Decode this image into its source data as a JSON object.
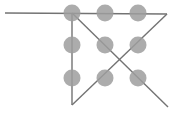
{
  "figure": {
    "width": 177,
    "height": 115,
    "background_color": "#ffffff",
    "line_color": "#737373",
    "line_width": 1.4,
    "dot_color": "#9e9e9e",
    "dot_opacity": 0.85,
    "dot_radius": 8.5,
    "segments": [
      {
        "name": "horizontal-top-line",
        "x1": 5,
        "y1": 13,
        "x2": 167,
        "y2": 14
      },
      {
        "name": "vertical-left-line",
        "x1": 72,
        "y1": 13,
        "x2": 72,
        "y2": 105
      },
      {
        "name": "diagonal-down-right",
        "x1": 72,
        "y1": 13,
        "x2": 168,
        "y2": 107
      },
      {
        "name": "diagonal-down-left",
        "x1": 167,
        "y1": 14,
        "x2": 72,
        "y2": 105
      }
    ],
    "dots": [
      {
        "name": "dot-r1c1",
        "cx": 72,
        "cy": 13
      },
      {
        "name": "dot-r1c2",
        "cx": 105,
        "cy": 13
      },
      {
        "name": "dot-r1c3",
        "cx": 138,
        "cy": 13
      },
      {
        "name": "dot-r2c1",
        "cx": 72,
        "cy": 45
      },
      {
        "name": "dot-r2c2",
        "cx": 105,
        "cy": 45
      },
      {
        "name": "dot-r2c3",
        "cx": 138,
        "cy": 45
      },
      {
        "name": "dot-r3c1",
        "cx": 72,
        "cy": 78
      },
      {
        "name": "dot-r3c2",
        "cx": 105,
        "cy": 78
      },
      {
        "name": "dot-r3c3",
        "cx": 138,
        "cy": 78
      }
    ]
  },
  "chart_data": {
    "type": "scatter",
    "title": "",
    "xlabel": "",
    "ylabel": "",
    "grid": false,
    "legend": "none",
    "xlim": [
      0,
      177
    ],
    "ylim": [
      115,
      0
    ],
    "series": [
      {
        "name": "marked-points",
        "x": [
          72,
          105,
          138,
          72,
          105,
          138,
          72,
          105,
          138
        ],
        "y": [
          13,
          13,
          13,
          45,
          45,
          45,
          78,
          78,
          78
        ]
      }
    ],
    "annotations": [
      {
        "type": "line",
        "name": "horizontal-top-line",
        "points": [
          [
            5,
            13
          ],
          [
            167,
            14
          ]
        ]
      },
      {
        "type": "line",
        "name": "vertical-left-line",
        "points": [
          [
            72,
            13
          ],
          [
            72,
            105
          ]
        ]
      },
      {
        "type": "line",
        "name": "diagonal-down-right",
        "points": [
          [
            72,
            13
          ],
          [
            168,
            107
          ]
        ]
      },
      {
        "type": "line",
        "name": "diagonal-down-left",
        "points": [
          [
            167,
            14
          ],
          [
            72,
            105
          ]
        ]
      }
    ]
  }
}
